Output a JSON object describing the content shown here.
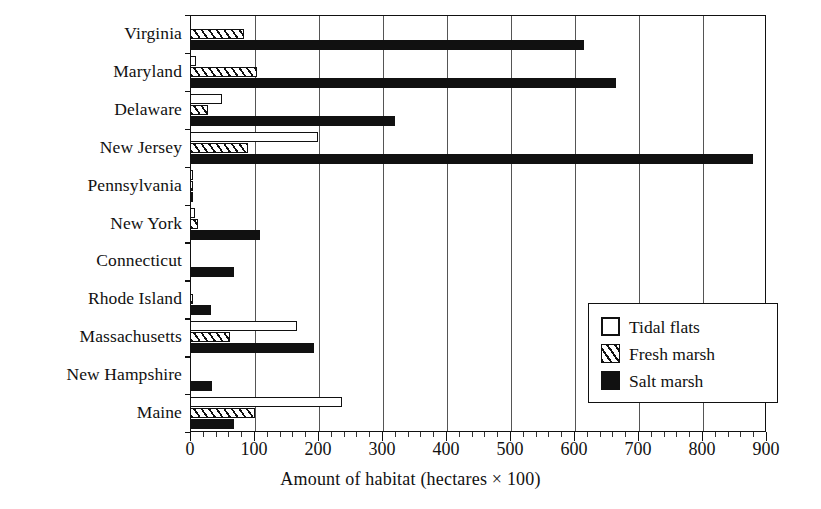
{
  "chart_data": {
    "type": "bar",
    "orientation": "horizontal",
    "title": "",
    "xlabel": "Amount of habitat (hectares × 100)",
    "ylabel": "",
    "xlim": [
      0,
      900
    ],
    "xticks": [
      0,
      100,
      200,
      300,
      400,
      500,
      600,
      700,
      800,
      900
    ],
    "xticklabels": [
      "0",
      "100",
      "200",
      "300",
      "400",
      "500",
      "600",
      "700",
      "800",
      "900"
    ],
    "minor_ticks_per_interval": 5,
    "grid": "vertical",
    "legend_position": "lower right",
    "categories": [
      "Virginia",
      "Maryland",
      "Delaware",
      "New Jersey",
      "Pennsylvania",
      "New York",
      "Connecticut",
      "Rhode Island",
      "Massachusetts",
      "New Hampshire",
      "Maine"
    ],
    "series": [
      {
        "name": "Tidal flats",
        "style": "open",
        "values": [
          0,
          10,
          50,
          200,
          4,
          8,
          0,
          0,
          167,
          0,
          238
        ]
      },
      {
        "name": "Fresh marsh",
        "style": "hatched",
        "values": [
          85,
          105,
          28,
          90,
          5,
          12,
          0,
          3,
          62,
          0,
          102
        ]
      },
      {
        "name": "Salt marsh",
        "style": "filled",
        "values": [
          615,
          665,
          320,
          880,
          3,
          110,
          68,
          33,
          194,
          34,
          68
        ]
      }
    ]
  },
  "legend": {
    "items": [
      {
        "label": "Tidal flats",
        "swatch": "open-square-icon"
      },
      {
        "label": "Fresh marsh",
        "swatch": "hatched-square-icon"
      },
      {
        "label": "Salt marsh",
        "swatch": "filled-square-icon"
      }
    ]
  },
  "colors": {
    "axis": "#111111",
    "grid": "#555555",
    "fill_dark": "#111111",
    "fill_light": "#ffffff",
    "background": "#ffffff"
  }
}
